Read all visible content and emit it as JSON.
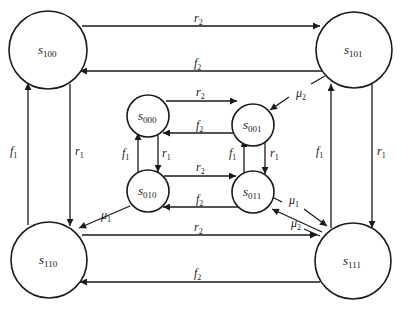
{
  "diagram": {
    "type": "state-transition-diagram",
    "nodes": [
      {
        "id": "s100",
        "base": "s",
        "sub": "100"
      },
      {
        "id": "s101",
        "base": "s",
        "sub": "101"
      },
      {
        "id": "s110",
        "base": "s",
        "sub": "110"
      },
      {
        "id": "s111",
        "base": "s",
        "sub": "111"
      },
      {
        "id": "s000",
        "base": "s",
        "sub": "000"
      },
      {
        "id": "s001",
        "base": "s",
        "sub": "001"
      },
      {
        "id": "s010",
        "base": "s",
        "sub": "010"
      },
      {
        "id": "s011",
        "base": "s",
        "sub": "011"
      }
    ],
    "edges": [
      {
        "from": "s100",
        "to": "s101",
        "base": "r",
        "sub": "2"
      },
      {
        "from": "s101",
        "to": "s100",
        "base": "f",
        "sub": "2"
      },
      {
        "from": "s110",
        "to": "s111",
        "base": "r",
        "sub": "2"
      },
      {
        "from": "s111",
        "to": "s110",
        "base": "f",
        "sub": "2"
      },
      {
        "from": "s100",
        "to": "s110",
        "base": "r",
        "sub": "1"
      },
      {
        "from": "s110",
        "to": "s100",
        "base": "f",
        "sub": "1"
      },
      {
        "from": "s101",
        "to": "s111",
        "base": "r",
        "sub": "1"
      },
      {
        "from": "s111",
        "to": "s101",
        "base": "f",
        "sub": "1"
      },
      {
        "from": "s000",
        "to": "s001",
        "base": "r",
        "sub": "2"
      },
      {
        "from": "s001",
        "to": "s000",
        "base": "f",
        "sub": "2"
      },
      {
        "from": "s010",
        "to": "s011",
        "base": "r",
        "sub": "2"
      },
      {
        "from": "s011",
        "to": "s010",
        "base": "f",
        "sub": "2"
      },
      {
        "from": "s000",
        "to": "s010",
        "base": "r",
        "sub": "1"
      },
      {
        "from": "s010",
        "to": "s000",
        "base": "f",
        "sub": "1"
      },
      {
        "from": "s001",
        "to": "s011",
        "base": "r",
        "sub": "1"
      },
      {
        "from": "s011",
        "to": "s001",
        "base": "f",
        "sub": "1"
      },
      {
        "from": "s010",
        "to": "s110",
        "base": "μ",
        "sub": "1"
      },
      {
        "from": "s011",
        "to": "s111",
        "base": "μ",
        "sub": "1"
      },
      {
        "from": "s101",
        "to": "s001",
        "base": "μ",
        "sub": "2"
      },
      {
        "from": "s111",
        "to": "s011",
        "base": "μ",
        "sub": "2"
      }
    ]
  },
  "labels": {
    "n_s100": {
      "base": "s",
      "sub": "100"
    },
    "n_s101": {
      "base": "s",
      "sub": "101"
    },
    "n_s110": {
      "base": "s",
      "sub": "110"
    },
    "n_s111": {
      "base": "s",
      "sub": "111"
    },
    "n_s000": {
      "base": "s",
      "sub": "000"
    },
    "n_s001": {
      "base": "s",
      "sub": "001"
    },
    "n_s010": {
      "base": "s",
      "sub": "010"
    },
    "n_s011": {
      "base": "s",
      "sub": "011"
    },
    "r2_top": {
      "base": "r",
      "sub": "2"
    },
    "f2_top": {
      "base": "f",
      "sub": "2"
    },
    "r2_bot": {
      "base": "r",
      "sub": "2"
    },
    "f2_bot": {
      "base": "f",
      "sub": "2"
    },
    "f1_left": {
      "base": "f",
      "sub": "1"
    },
    "r1_left": {
      "base": "r",
      "sub": "1"
    },
    "f1_right": {
      "base": "f",
      "sub": "1"
    },
    "r1_right": {
      "base": "r",
      "sub": "1"
    },
    "r2_in_top": {
      "base": "r",
      "sub": "2"
    },
    "f2_in_top": {
      "base": "f",
      "sub": "2"
    },
    "r2_in_bot": {
      "base": "r",
      "sub": "2"
    },
    "f2_in_bot": {
      "base": "f",
      "sub": "2"
    },
    "f1_in_left": {
      "base": "f",
      "sub": "1"
    },
    "r1_in_left": {
      "base": "r",
      "sub": "1"
    },
    "f1_in_right": {
      "base": "f",
      "sub": "1"
    },
    "r1_in_right": {
      "base": "r",
      "sub": "1"
    },
    "mu1_left": {
      "base": "μ",
      "sub": "1"
    },
    "mu1_right": {
      "base": "μ",
      "sub": "1"
    },
    "mu2_top": {
      "base": "μ",
      "sub": "2"
    },
    "mu2_bot": {
      "base": "μ",
      "sub": "2"
    }
  }
}
